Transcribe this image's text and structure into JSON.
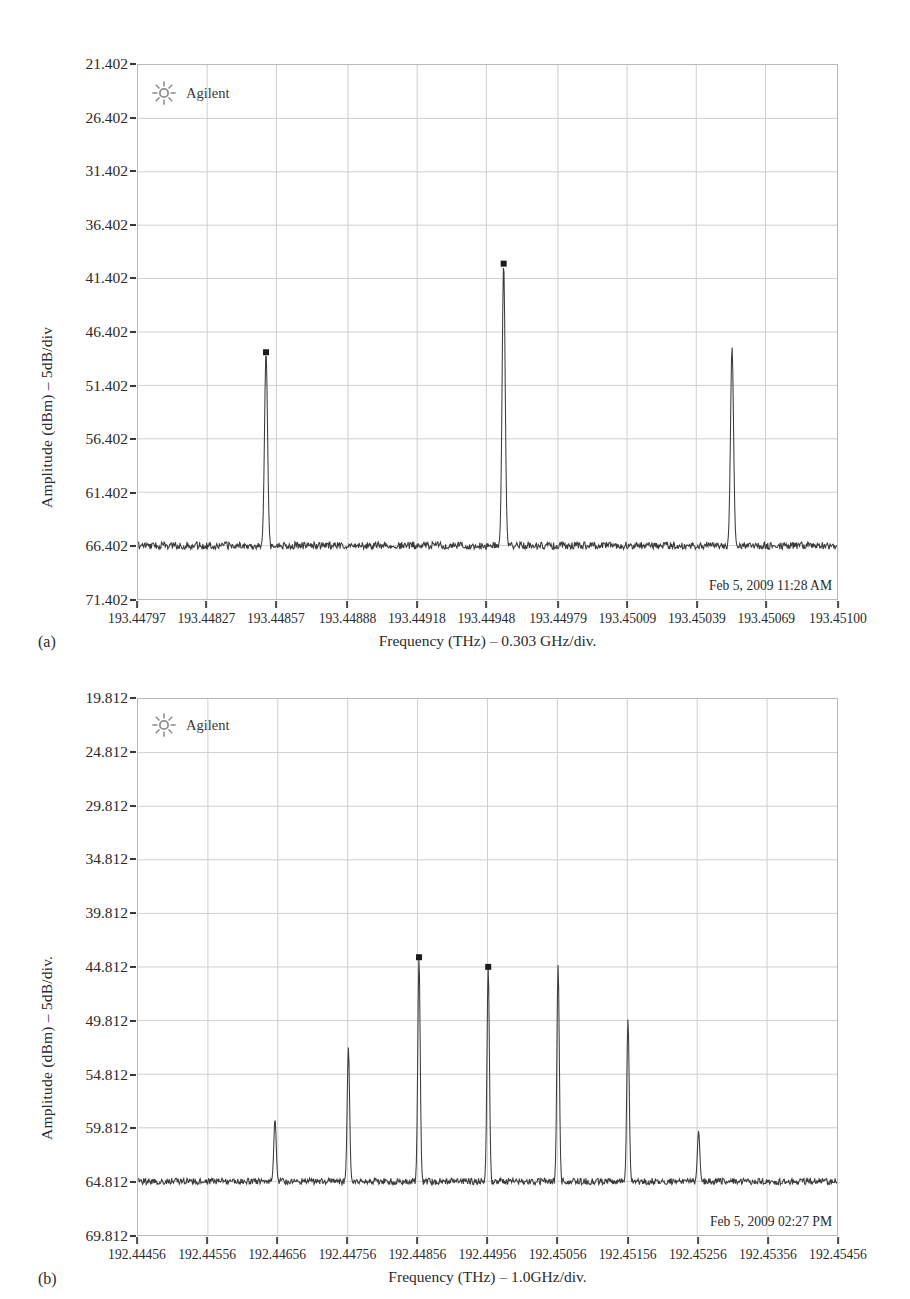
{
  "figure_a": {
    "caption": "(a)",
    "brand": "Agilent",
    "brand_icon": "agilent-sun-icon",
    "timestamp": "Feb 5, 2009 11:28 AM",
    "ylabel": "Amplitude (dBm) – 5dB/div",
    "xlabel": "Frequency (THz) – 0.303 GHz/div.",
    "chart_data": {
      "type": "line",
      "title": "",
      "xlabel": "Frequency (THz) – 0.303 GHz/div.",
      "ylabel": "Amplitude (dBm) – 5dB/div",
      "grid": true,
      "legend": "none",
      "instrument": "Agilent optical spectrum analyzer",
      "yticks": [
        "21.402",
        "26.402",
        "31.402",
        "36.402",
        "41.402",
        "46.402",
        "51.402",
        "56.402",
        "61.402",
        "66.402",
        "71.402"
      ],
      "ytick_values": [
        21.402,
        26.402,
        31.402,
        36.402,
        41.402,
        46.402,
        51.402,
        56.402,
        61.402,
        66.402,
        71.402
      ],
      "ylim": [
        21.402,
        71.402
      ],
      "y_axis_inverted_display": true,
      "y_units": "dBm (axis labels increase downward, 5 dB/div)",
      "xticks": [
        "193.44797",
        "193.44827",
        "193.44857",
        "193.44888",
        "193.44918",
        "193.44948",
        "193.44979",
        "193.45009",
        "193.45039",
        "193.45069",
        "193.45100"
      ],
      "xtick_values": [
        193.44797,
        193.44827,
        193.44857,
        193.44888,
        193.44918,
        193.44948,
        193.44979,
        193.45009,
        193.45039,
        193.45069,
        193.451
      ],
      "xlim": [
        193.44797,
        193.451
      ],
      "noise_floor": 66.402,
      "peaks": [
        {
          "x": 193.448525,
          "y": 48.3,
          "label_marker": true
        },
        {
          "x": 193.449555,
          "y": 40.0,
          "label_marker": true
        },
        {
          "x": 193.450545,
          "y": 47.8,
          "label_marker": false
        }
      ],
      "notes": "Three optical carriers above a flat noise floor at approximately 66.4 dBm axis units"
    }
  },
  "figure_b": {
    "caption": "(b)",
    "brand": "Agilent",
    "brand_icon": "agilent-sun-icon",
    "timestamp": "Feb 5, 2009 02:27 PM",
    "ylabel": "Amplitude (dBm) – 5dB/div.",
    "xlabel": "Frequency (THz) – 1.0GHz/div.",
    "chart_data": {
      "type": "line",
      "title": "",
      "xlabel": "Frequency (THz) – 1.0GHz/div.",
      "ylabel": "Amplitude (dBm) – 5dB/div.",
      "grid": true,
      "legend": "none",
      "instrument": "Agilent optical spectrum analyzer",
      "yticks": [
        "19.812",
        "24.812",
        "29.812",
        "34.812",
        "39.812",
        "44.812",
        "49.812",
        "54.812",
        "59.812",
        "64.812",
        "69.812"
      ],
      "ytick_values": [
        19.812,
        24.812,
        29.812,
        34.812,
        39.812,
        44.812,
        49.812,
        54.812,
        59.812,
        64.812,
        69.812
      ],
      "ylim": [
        19.812,
        69.812
      ],
      "y_axis_inverted_display": true,
      "y_units": "dBm (axis labels increase downward, 5 dB/div)",
      "xticks": [
        "192.44456",
        "192.44556",
        "192.44656",
        "192.44756",
        "192.44856",
        "192.44956",
        "192.45056",
        "192.45156",
        "192.45256",
        "192.45356",
        "192.45456"
      ],
      "xtick_values": [
        192.44456,
        192.44556,
        192.44656,
        192.44756,
        192.44856,
        192.44956,
        192.45056,
        192.45156,
        192.45256,
        192.45356,
        192.45456
      ],
      "xlim": [
        192.44456,
        192.45456
      ],
      "noise_floor": 64.812,
      "peaks": [
        {
          "x": 192.44652,
          "y": 59.0,
          "label_marker": false
        },
        {
          "x": 192.44757,
          "y": 52.3,
          "label_marker": false
        },
        {
          "x": 192.44858,
          "y": 43.9,
          "label_marker": true
        },
        {
          "x": 192.44957,
          "y": 44.8,
          "label_marker": true
        },
        {
          "x": 192.45057,
          "y": 44.6,
          "label_marker": false
        },
        {
          "x": 192.45157,
          "y": 49.7,
          "label_marker": false
        },
        {
          "x": 192.45258,
          "y": 60.1,
          "label_marker": false
        }
      ],
      "notes": "Seven comb lines of decreasing then increasing amplitude above a flat noise floor near 64.8 dBm axis units"
    }
  }
}
